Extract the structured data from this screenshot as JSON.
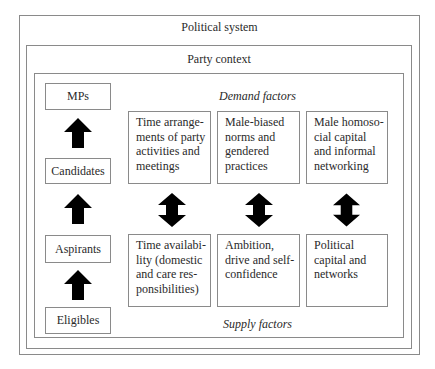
{
  "outer": {
    "title": "Political system"
  },
  "party": {
    "title": "Party context"
  },
  "stages": [
    {
      "label": "MPs"
    },
    {
      "label": "Candidates"
    },
    {
      "label": "Aspirants"
    },
    {
      "label": "Eligibles"
    }
  ],
  "demand": {
    "heading": "Demand factors",
    "items": [
      {
        "text": "Time arrange-\nments of party\nactivities and\nmeetings"
      },
      {
        "text": "Male-biased\nnorms and\ngendered\npractices"
      },
      {
        "text": "Male homoso-\ncial capital\nand informal\nnetworking"
      }
    ]
  },
  "supply": {
    "heading": "Supply factors",
    "items": [
      {
        "text": "Time availabi-\nlity (domestic\nand care res-\nponsibilities)"
      },
      {
        "text": "Ambition,\ndrive and self-\nconfidence"
      },
      {
        "text": "Political\ncapital and\nnetworks"
      }
    ]
  },
  "arrows": {
    "stage_arrows": [
      "up-arrow",
      "up-arrow",
      "up-arrow"
    ],
    "factor_arrows": [
      "double-arrow",
      "double-arrow",
      "double-arrow"
    ],
    "color": "#000000"
  }
}
